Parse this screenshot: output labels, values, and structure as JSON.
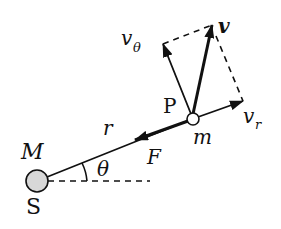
{
  "diagram": {
    "colors": {
      "ink": "#111111",
      "sun_fill": "#d8d8d8",
      "background": "#ffffff"
    },
    "labels": {
      "sun_mass": "M",
      "sun_name": "S",
      "particle_name": "P",
      "particle_mass": "m",
      "radius": "r",
      "angle": "θ",
      "force": "F",
      "velocity": "v",
      "v_radial_base": "v",
      "v_radial_sub": "r",
      "v_theta_base": "v",
      "v_theta_sub": "θ"
    },
    "nodes": [
      {
        "id": "S",
        "x": 37,
        "y": 181,
        "r": 11
      },
      {
        "id": "P",
        "x": 193,
        "y": 119,
        "r": 6
      }
    ],
    "vectors": [
      {
        "id": "v",
        "from": "P",
        "to": [
          212,
          25
        ],
        "style": "bold"
      },
      {
        "id": "v_theta",
        "from": "P",
        "to": [
          163,
          44
        ],
        "style": "normal"
      },
      {
        "id": "v_r",
        "from": "P",
        "to": [
          243,
          101
        ],
        "style": "normal"
      },
      {
        "id": "F",
        "from": "P",
        "to": [
          135,
          140
        ],
        "style": "bold"
      }
    ],
    "dashed_lines": [
      {
        "from": [
          163,
          44
        ],
        "to": [
          212,
          25
        ]
      },
      {
        "from": [
          212,
          25
        ],
        "to": [
          243,
          101
        ]
      },
      {
        "from": [
          48,
          181
        ],
        "to": [
          150,
          181
        ]
      }
    ]
  }
}
